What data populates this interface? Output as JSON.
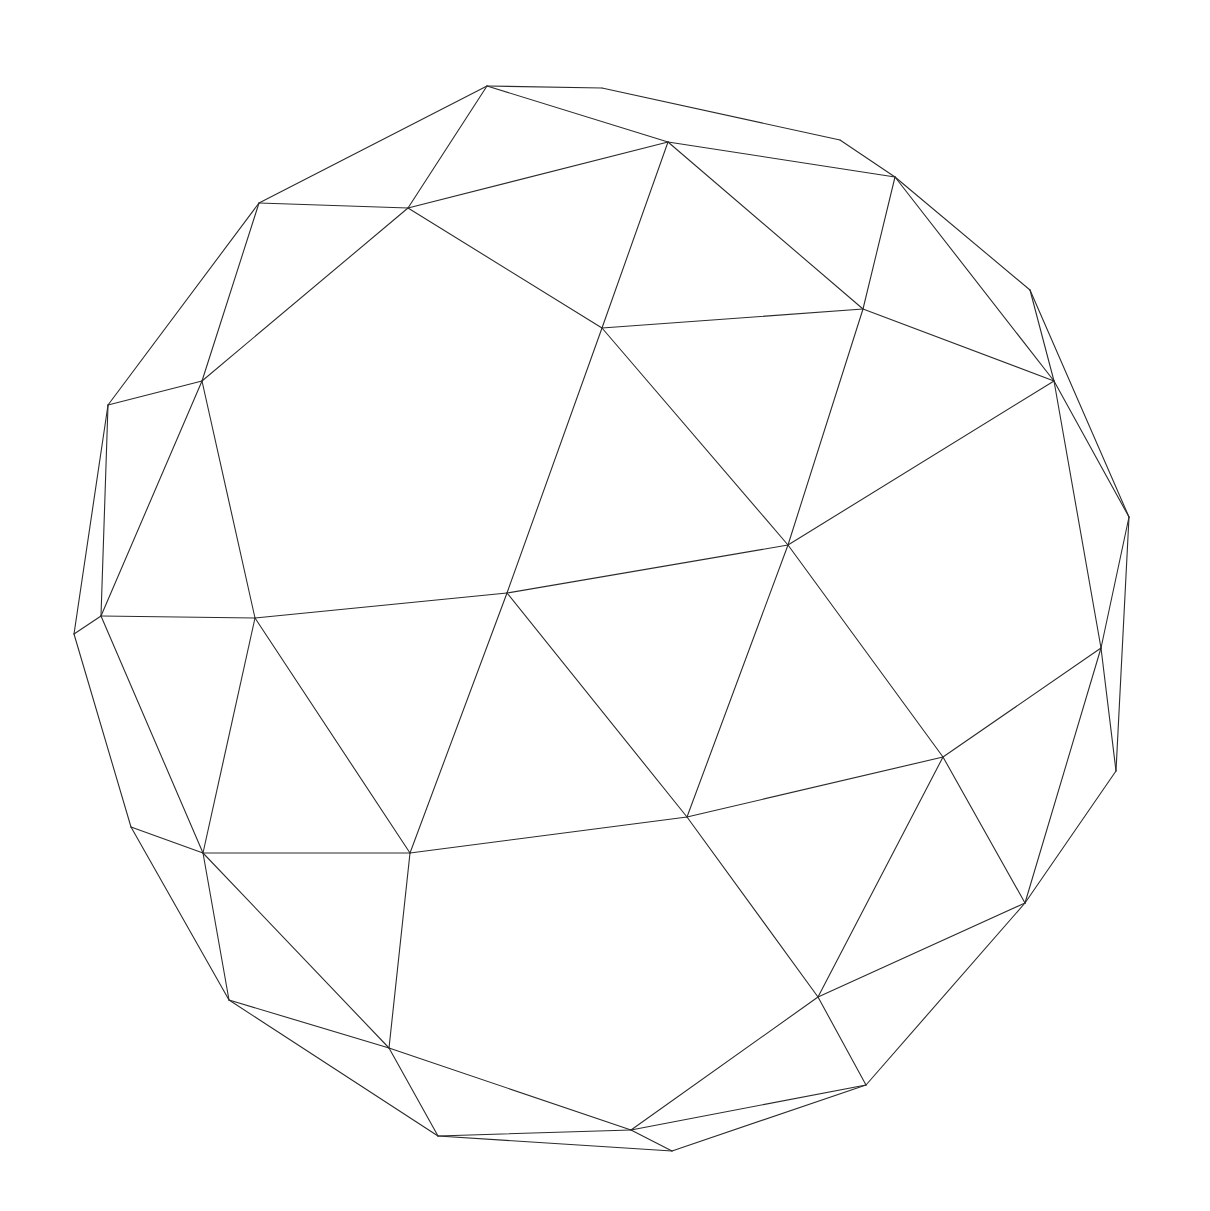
{
  "figure": {
    "background_color": "#ffffff",
    "stroke_color": "#2b2b2b",
    "vertices": {
      "A": [
        487,
        86
      ],
      "B": [
        602,
        88
      ],
      "C": [
        840,
        140
      ],
      "D": [
        895,
        177
      ],
      "E": [
        1030,
        290
      ],
      "F": [
        1129,
        517
      ],
      "G": [
        1116,
        771
      ],
      "H": [
        1025,
        903
      ],
      "I": [
        866,
        1085
      ],
      "J": [
        672,
        1151
      ],
      "K": [
        438,
        1136
      ],
      "L": [
        229,
        1000
      ],
      "M": [
        131,
        827
      ],
      "N": [
        74,
        634
      ],
      "O": [
        108,
        405
      ],
      "P": [
        259,
        203
      ],
      "Q": [
        408,
        208
      ],
      "R": [
        668,
        142
      ],
      "S": [
        602,
        328
      ],
      "T": [
        863,
        309
      ],
      "U": [
        1054,
        381
      ],
      "V": [
        202,
        381
      ],
      "W": [
        101,
        616
      ],
      "X": [
        255,
        618
      ],
      "Y": [
        507,
        593
      ],
      "Z": [
        788,
        545
      ],
      "AA": [
        1101,
        648
      ],
      "AB": [
        943,
        757
      ],
      "AC": [
        687,
        817
      ],
      "AD": [
        410,
        853
      ],
      "AE": [
        203,
        853
      ],
      "AF": [
        389,
        1048
      ],
      "AG": [
        818,
        997
      ],
      "AH": [
        631,
        1130
      ]
    },
    "edges": [
      [
        "A",
        "B"
      ],
      [
        "B",
        "C"
      ],
      [
        "C",
        "D"
      ],
      [
        "D",
        "E"
      ],
      [
        "E",
        "F"
      ],
      [
        "F",
        "G"
      ],
      [
        "G",
        "H"
      ],
      [
        "H",
        "I"
      ],
      [
        "I",
        "J"
      ],
      [
        "J",
        "K"
      ],
      [
        "K",
        "L"
      ],
      [
        "L",
        "M"
      ],
      [
        "M",
        "N"
      ],
      [
        "N",
        "O"
      ],
      [
        "O",
        "P"
      ],
      [
        "P",
        "A"
      ],
      [
        "A",
        "Q"
      ],
      [
        "A",
        "R"
      ],
      [
        "P",
        "Q"
      ],
      [
        "Q",
        "R"
      ],
      [
        "R",
        "D"
      ],
      [
        "R",
        "S"
      ],
      [
        "R",
        "T"
      ],
      [
        "D",
        "T"
      ],
      [
        "D",
        "U"
      ],
      [
        "E",
        "U"
      ],
      [
        "T",
        "S"
      ],
      [
        "T",
        "U"
      ],
      [
        "T",
        "Z"
      ],
      [
        "U",
        "F"
      ],
      [
        "U",
        "AA"
      ],
      [
        "F",
        "AA"
      ],
      [
        "G",
        "AA"
      ],
      [
        "H",
        "AA"
      ],
      [
        "AA",
        "AB"
      ],
      [
        "Z",
        "AB"
      ],
      [
        "Z",
        "U"
      ],
      [
        "Z",
        "AC"
      ],
      [
        "S",
        "Z"
      ],
      [
        "S",
        "Y"
      ],
      [
        "Q",
        "S"
      ],
      [
        "Q",
        "V"
      ],
      [
        "P",
        "V"
      ],
      [
        "O",
        "V"
      ],
      [
        "V",
        "W"
      ],
      [
        "O",
        "W"
      ],
      [
        "N",
        "W"
      ],
      [
        "V",
        "X"
      ],
      [
        "W",
        "X"
      ],
      [
        "X",
        "Y"
      ],
      [
        "Y",
        "Z"
      ],
      [
        "Y",
        "AC"
      ],
      [
        "Y",
        "AD"
      ],
      [
        "X",
        "AD"
      ],
      [
        "W",
        "AE"
      ],
      [
        "X",
        "AE"
      ],
      [
        "AE",
        "AD"
      ],
      [
        "AD",
        "AC"
      ],
      [
        "AC",
        "AB"
      ],
      [
        "AB",
        "H"
      ],
      [
        "AB",
        "AG"
      ],
      [
        "AC",
        "AG"
      ],
      [
        "AG",
        "H"
      ],
      [
        "AG",
        "I"
      ],
      [
        "AG",
        "AH"
      ],
      [
        "AH",
        "I"
      ],
      [
        "AH",
        "J"
      ],
      [
        "AH",
        "K"
      ],
      [
        "AH",
        "AF"
      ],
      [
        "AF",
        "K"
      ],
      [
        "AF",
        "L"
      ],
      [
        "AF",
        "AD"
      ],
      [
        "AF",
        "AE"
      ],
      [
        "AE",
        "L"
      ],
      [
        "AE",
        "M"
      ]
    ]
  }
}
